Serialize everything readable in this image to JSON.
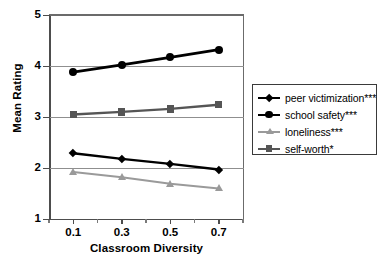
{
  "chart_data": {
    "type": "line",
    "title": "",
    "xlabel": "Classroom Diversity",
    "ylabel": "Mean Rating",
    "x": [
      0.1,
      0.3,
      0.5,
      0.7
    ],
    "xtick_labels": [
      "0.1",
      "0.3",
      "0.5",
      "0.7"
    ],
    "ytick_labels": [
      "1",
      "2",
      "3",
      "4",
      "5"
    ],
    "ylim": [
      1,
      5
    ],
    "xlim": [
      0.0,
      0.8
    ],
    "grid": "horizontal",
    "gridlines_at": [
      2,
      3,
      4
    ],
    "legend_position": "right",
    "series": [
      {
        "name": "peer victimization***",
        "values": [
          2.29,
          2.18,
          2.08,
          1.97
        ],
        "color": "#000000",
        "marker": "diamond",
        "line_width": 2.4
      },
      {
        "name": "school safety***",
        "values": [
          3.88,
          4.02,
          4.17,
          4.32
        ],
        "color": "#000000",
        "marker": "circle",
        "line_width": 2.8
      },
      {
        "name": "loneliness***",
        "values": [
          1.92,
          1.82,
          1.69,
          1.6
        ],
        "color": "#9a9a9a",
        "marker": "triangle",
        "line_width": 2.0
      },
      {
        "name": "self-worth*",
        "values": [
          3.05,
          3.1,
          3.16,
          3.24
        ],
        "color": "#555555",
        "marker": "square",
        "line_width": 2.4
      }
    ]
  },
  "legend": {
    "items": [
      {
        "label": "peer victimization***"
      },
      {
        "label": "school safety***"
      },
      {
        "label": "loneliness***"
      },
      {
        "label": "self-worth*"
      }
    ]
  },
  "axes": {
    "y_title": "Mean Rating",
    "x_title": "Classroom Diversity",
    "y_ticks": [
      "5",
      "4",
      "3",
      "2",
      "1"
    ],
    "x_ticks": [
      "0.1",
      "0.3",
      "0.5",
      "0.7"
    ]
  },
  "colors": {
    "axis": "#4d4d4d",
    "grid": "#8f8f8f",
    "black_series": "#000000",
    "dark_gray_series": "#555555",
    "light_gray_series": "#9a9a9a",
    "background": "#ffffff"
  }
}
